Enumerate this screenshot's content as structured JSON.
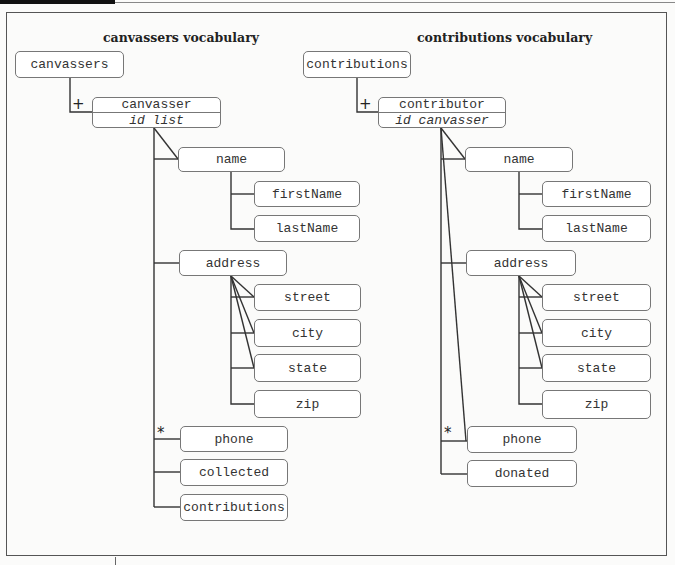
{
  "left": {
    "title": "canvassers vocabulary",
    "root": "canvassers",
    "root_cardinality": "+",
    "element": {
      "name": "canvasser",
      "attributes": "id list"
    },
    "children": {
      "name": "name",
      "firstName": "firstName",
      "lastName": "lastName",
      "address": "address",
      "street": "street",
      "city": "city",
      "state": "state",
      "zip": "zip",
      "phone": "phone",
      "phone_cardinality": "*",
      "collected": "collected",
      "contributions": "contributions"
    }
  },
  "right": {
    "title": "contributions vocabulary",
    "root": "contributions",
    "root_cardinality": "+",
    "element": {
      "name": "contributor",
      "attributes": "id canvasser"
    },
    "children": {
      "name": "name",
      "firstName": "firstName",
      "lastName": "lastName",
      "address": "address",
      "street": "street",
      "city": "city",
      "state": "state",
      "zip": "zip",
      "phone": "phone",
      "phone_cardinality": "*",
      "donated": "donated"
    }
  },
  "colors": {
    "line": "#333333",
    "border": "#777777",
    "background": "#fbfbfa"
  }
}
